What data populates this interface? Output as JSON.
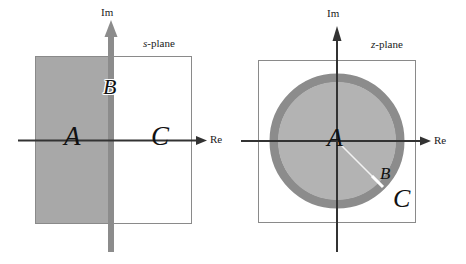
{
  "figure": {
    "width": 466,
    "height": 264,
    "background": "#ffffff"
  },
  "colors": {
    "shade_fill": "#a8a8a8",
    "ring_stroke": "#8c8c8c",
    "disk_fill": "#b3b3b3",
    "axis_dark": "#333333",
    "bar_gray": "#8c8c8c",
    "box_outline": "#8a8a8a",
    "text": "#111111",
    "label_text": "#1a1a1a"
  },
  "panels": [
    {
      "id": "s-plane",
      "plane_label": {
        "italic_part": "s",
        "rest": "-plane"
      },
      "axes": {
        "imaginary_label": "Im",
        "real_label": "Re"
      },
      "regions": [
        {
          "key": "A",
          "label": "A",
          "description": "left-half-plane-shaded"
        },
        {
          "key": "B",
          "label": "B",
          "description": "imaginary-axis-bar"
        },
        {
          "key": "C",
          "label": "C",
          "description": "right-half-plane"
        }
      ]
    },
    {
      "id": "z-plane",
      "plane_label": {
        "italic_part": "z",
        "rest": "-plane"
      },
      "axes": {
        "imaginary_label": "Im",
        "real_label": "Re"
      },
      "regions": [
        {
          "key": "A",
          "label": "A",
          "description": "inside-unit-circle"
        },
        {
          "key": "B",
          "label": "B",
          "description": "unit-circle-ring"
        },
        {
          "key": "C",
          "label": "C",
          "description": "outside-unit-circle"
        }
      ]
    }
  ]
}
